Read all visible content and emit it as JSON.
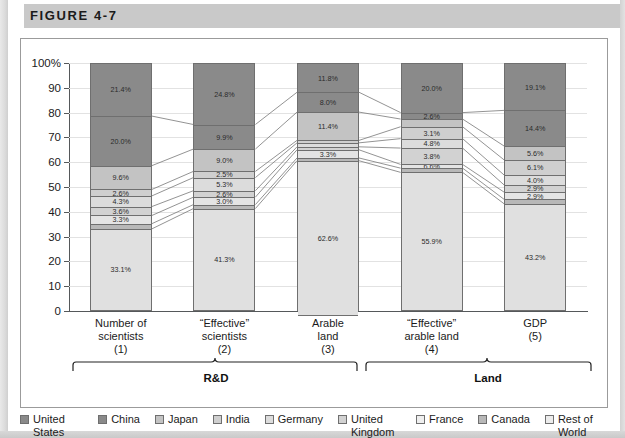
{
  "figure": {
    "label": "FIGURE 4-7"
  },
  "chart_data": {
    "type": "bar",
    "subtype": "stacked-percentage-with-connectors",
    "title": "FIGURE 4-7",
    "xlabel": "",
    "ylabel": "",
    "ylim": [
      0,
      100
    ],
    "ytick_labels": [
      "100%",
      "90",
      "80",
      "70",
      "60",
      "50",
      "40",
      "30",
      "20",
      "10",
      "0"
    ],
    "ytick_values": [
      100,
      90,
      80,
      70,
      60,
      50,
      40,
      30,
      20,
      10,
      0
    ],
    "grid": true,
    "legend_position": "bottom",
    "categories": [
      "Number of scientists (1)",
      "\"Effective\" scientists (2)",
      "Arable land (3)",
      "\"Effective\" arable land (4)",
      "GDP (5)"
    ],
    "category_lines": [
      [
        "Number of",
        "scientists",
        "(1)"
      ],
      [
        "“Effective”",
        "scientists",
        "(2)"
      ],
      [
        "Arable",
        "land",
        "(3)"
      ],
      [
        "“Effective”",
        "arable land",
        "(4)"
      ],
      [
        "GDP",
        "(5)"
      ]
    ],
    "group_brackets": [
      {
        "label": "R&D",
        "categories": [
          0,
          1
        ]
      },
      {
        "label": "Land",
        "categories": [
          2,
          3,
          4
        ]
      }
    ],
    "series": [
      {
        "name": "United States",
        "color": "#8a8a8a",
        "values": [
          21.4,
          24.8,
          11.8,
          20.0,
          19.1
        ]
      },
      {
        "name": "China",
        "color": "#8a8a8a",
        "values": [
          20.0,
          9.9,
          8.0,
          2.6,
          14.4
        ]
      },
      {
        "name": "Japan",
        "color": "#c3c3c3",
        "values": [
          9.6,
          9.0,
          11.4,
          3.1,
          5.6
        ]
      },
      {
        "name": "India",
        "color": "#cfcfcf",
        "values": [
          2.6,
          2.5,
          1.0,
          4.8,
          6.1
        ]
      },
      {
        "name": "Germany",
        "color": "#dcdcdc",
        "values": [
          4.3,
          5.3,
          1.6,
          3.8,
          4.0
        ]
      },
      {
        "name": "United Kingdom",
        "color": "#d2d2d2",
        "values": [
          3.6,
          2.6,
          1.2,
          6.6,
          2.9
        ]
      },
      {
        "name": "France",
        "color": "#e4e4e4",
        "values": [
          3.3,
          3.0,
          3.3,
          1.5,
          2.9
        ]
      },
      {
        "name": "Canada",
        "color": "#b8b8b8",
        "values": [
          2.1,
          1.6,
          1.1,
          1.7,
          1.8
        ]
      },
      {
        "name": "Rest of World",
        "color": "#e0e0e0",
        "values": [
          33.1,
          41.3,
          62.6,
          55.9,
          43.2
        ]
      }
    ],
    "bar_labels": {
      "bar1": [
        "21.4%",
        "20.0%",
        "9.6%",
        "2.6%",
        "4.3%",
        "3.6%",
        "3.3%",
        "",
        "33.1%"
      ],
      "bar2": [
        "24.8%",
        "9.9%",
        "9.0%",
        "2.5%",
        "5.3%",
        "2.6%",
        "3.0%",
        "",
        "41.3%"
      ],
      "bar3": [
        "11.8%",
        "8.0%",
        "11.4%",
        "",
        "",
        "",
        "3.3%",
        "",
        "62.6%"
      ],
      "bar4": [
        "20.0%",
        "2.6%",
        "",
        "3.1%",
        "4.8%",
        "3.8%",
        "6.6%",
        "",
        "55.9%"
      ],
      "bar5": [
        "19.1%",
        "14.4%",
        "5.6%",
        "6.1%",
        "4.0%",
        "2.9%",
        "2.9%",
        "",
        "43.2%"
      ]
    }
  },
  "legend": {
    "items": [
      {
        "label": "United States",
        "color": "#8a8a8a"
      },
      {
        "label": "China",
        "color": "#8a8a8a"
      },
      {
        "label": "Japan",
        "color": "#c3c3c3"
      },
      {
        "label": "India",
        "color": "#cfcfcf"
      },
      {
        "label": "Germany",
        "color": "#dcdcdc"
      },
      {
        "label": "United Kingdom",
        "color": "#d2d2d2"
      },
      {
        "label": "France",
        "color": "#efefef"
      },
      {
        "label": "Canada",
        "color": "#b8b8b8"
      },
      {
        "label": "Rest of World",
        "color": "#ececec"
      }
    ]
  }
}
